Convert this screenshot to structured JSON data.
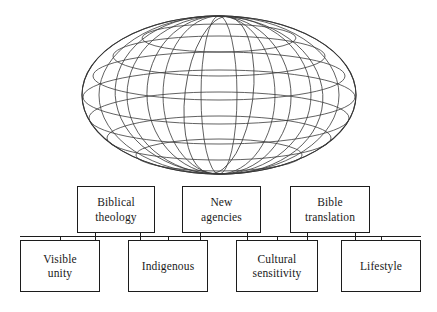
{
  "diagram": {
    "stroke_color": "#1c1c1c",
    "wire_color": "#3a3a3a",
    "background_color": "#ffffff",
    "globe": {
      "icon_name": "wireframe-globe",
      "latitude_lines": 7,
      "longitude_lines": 8
    },
    "top_row": [
      {
        "label": "Biblical\ntheology",
        "x": 77,
        "y": 186,
        "w": 78,
        "h": 47
      },
      {
        "label": "New\nagencies",
        "x": 182,
        "y": 186,
        "w": 79,
        "h": 47
      },
      {
        "label": "Bible\ntranslation",
        "x": 290,
        "y": 186,
        "w": 80,
        "h": 47
      },
      {
        "label": "",
        "x": 0,
        "y": 0,
        "w": 0,
        "h": 0
      }
    ],
    "bottom_row": [
      {
        "label": "Visible\nunity",
        "x": 20,
        "y": 240,
        "w": 80,
        "h": 52
      },
      {
        "label": "Indigenous",
        "x": 128,
        "y": 240,
        "w": 80,
        "h": 52
      },
      {
        "label": "Cultural\nsensitivity",
        "x": 236,
        "y": 240,
        "w": 82,
        "h": 52
      },
      {
        "label": "Lifestyle",
        "x": 341,
        "y": 240,
        "w": 80,
        "h": 52
      }
    ],
    "connector": {
      "name": "horizontal-rail",
      "y": 236,
      "x_start": 20,
      "x_end": 421
    }
  }
}
